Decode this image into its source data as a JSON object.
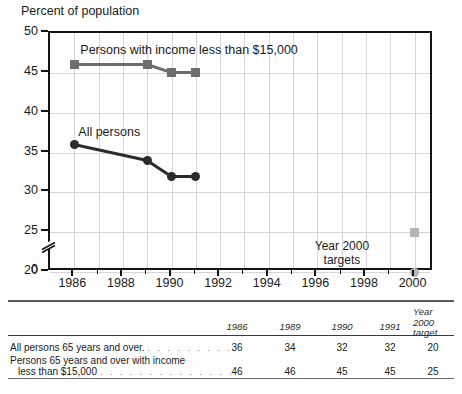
{
  "chart_data": {
    "type": "line",
    "title": "Percent of population",
    "xlabel": "",
    "ylabel": "Percent of population",
    "xlim": [
      1985,
      2000.8
    ],
    "ylim": [
      20,
      50
    ],
    "y_axis_break": true,
    "y_break_label": "0",
    "grid": true,
    "legend": "inline-annotations",
    "yticks": [
      20,
      25,
      30,
      35,
      40,
      45,
      50
    ],
    "ytick_labels": [
      "20",
      "25",
      "30",
      "35",
      "40",
      "45",
      "50"
    ],
    "xticks_major": [
      1986,
      1988,
      1990,
      1992,
      1994,
      1996,
      1998,
      2000
    ],
    "xtick_labels": [
      "1986",
      "1988",
      "1990",
      "1992",
      "1994",
      "1996",
      "1998",
      "2000"
    ],
    "xticks_minor": [
      1987,
      1989,
      1991,
      1993,
      1995,
      1997,
      1999
    ],
    "x": [
      1986,
      1989,
      1990,
      1991
    ],
    "series": [
      {
        "name": "Persons with income less than $15,000",
        "label": "Persons with income less than $15,000",
        "values": [
          46,
          46,
          45,
          45
        ],
        "marker": "square",
        "color": "#6e6e6e",
        "target_year": 2000,
        "target_value": 25,
        "target_color": "#b4b4b4"
      },
      {
        "name": "All persons",
        "label": "All persons",
        "values": [
          36,
          34,
          32,
          32
        ],
        "marker": "circle",
        "color": "#2b2b2b",
        "target_year": 2000,
        "target_value": 20,
        "target_color": "#b4b4b4"
      }
    ],
    "annotations": [
      {
        "text_line1": "Year 2000",
        "text_line2": "targets",
        "x": 1998.2,
        "y": 22.6
      }
    ]
  },
  "table": {
    "columns": [
      {
        "label": "1986"
      },
      {
        "label": "1989"
      },
      {
        "label": "1990"
      },
      {
        "label": "1991"
      },
      {
        "label_line1": "Year",
        "label_line2": "2000",
        "label_line3": "target"
      }
    ],
    "rows": [
      {
        "label": "All persons 65 years and over.",
        "leader": ". . . . . . . . .",
        "values": [
          "36",
          "34",
          "32",
          "32",
          "20"
        ]
      },
      {
        "label_line1": "Persons 65 years and over with income",
        "label_line2": "less than $15,000",
        "leader": ". . . . . . . . . . . . . . .",
        "values": [
          "46",
          "46",
          "45",
          "45",
          "25"
        ]
      }
    ]
  },
  "colors": {
    "series_dark": "#2b2b2b",
    "series_gray": "#6e6e6e",
    "target_gray": "#b4b4b4",
    "grid": "#d6d6d6",
    "frame": "#151515"
  }
}
